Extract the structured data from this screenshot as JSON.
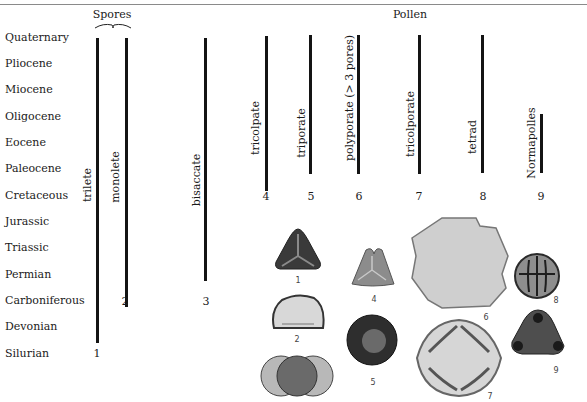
{
  "headers": {
    "spores": "Spores",
    "pollen": "Pollen"
  },
  "eras": [
    "Quaternary",
    "Pliocene",
    "Miocene",
    "Oligocene",
    "Eocene",
    "Paleocene",
    "Cretaceous",
    "Jurassic",
    "Triassic",
    "Permian",
    "Carboniferous",
    "Devonian",
    "Silurian"
  ],
  "ranges": [
    {
      "number": "1",
      "label": "trilete",
      "group": "Spores",
      "from": "Silurian",
      "to": "Quaternary"
    },
    {
      "number": "2",
      "label": "monolete",
      "group": "Spores",
      "from": "Carboniferous",
      "to": "Quaternary"
    },
    {
      "number": "3",
      "label": "bisaccate",
      "group": "Spores",
      "from": "Permian",
      "to": "Quaternary"
    },
    {
      "number": "4",
      "label": "tricolpate",
      "group": "Pollen",
      "from": "Cretaceous",
      "to": "Quaternary"
    },
    {
      "number": "5",
      "label": "triporate",
      "group": "Pollen",
      "from": "Cretaceous",
      "to": "Quaternary"
    },
    {
      "number": "6",
      "label": "polyporate (> 3 pores)",
      "group": "Pollen",
      "from": "Cretaceous",
      "to": "Quaternary"
    },
    {
      "number": "7",
      "label": "tricolporate",
      "group": "Pollen",
      "from": "Cretaceous",
      "to": "Quaternary"
    },
    {
      "number": "8",
      "label": "tetrad",
      "group": "Pollen",
      "from": "Cretaceous",
      "to": "Quaternary"
    },
    {
      "number": "9",
      "label": "Normapolles",
      "group": "Pollen",
      "from": "Cretaceous",
      "to": "Oligocene"
    }
  ],
  "specimen_captions": [
    "1",
    "2",
    "4",
    "5",
    "6",
    "7",
    "8",
    "9"
  ]
}
